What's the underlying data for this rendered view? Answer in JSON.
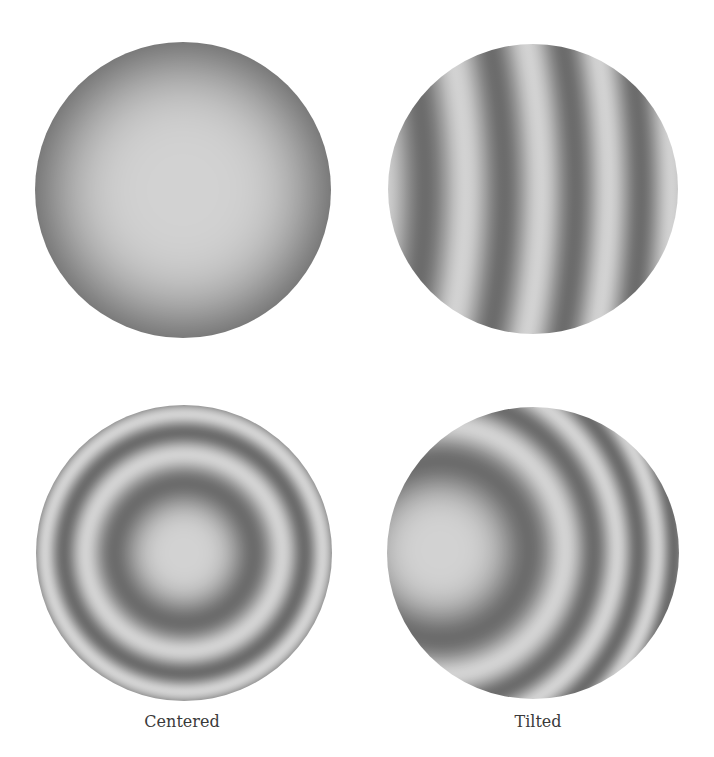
{
  "figure": {
    "colors": {
      "background": "#ffffff",
      "fringe_dark": "#6c6c6c",
      "fringe_light": "#d2d2d2",
      "label": "#3a3a3a"
    },
    "panels": [
      {
        "id": "top-left",
        "name": "defocus-half-fringe",
        "cx": 183,
        "cy": 190,
        "r": 148,
        "ring_cx": 183,
        "ring_cy": 190,
        "r2_period": 58000,
        "phase": 0
      },
      {
        "id": "top-right",
        "name": "tilted-straightish-fringes",
        "cx": 533,
        "cy": 189,
        "r": 145,
        "ring_cx": -225,
        "ring_cy": 190,
        "r2_period": 109000,
        "phase": 0.62
      },
      {
        "id": "bottom-left",
        "name": "centered-rings",
        "cx": 184,
        "cy": 553,
        "r": 148,
        "ring_cx": 184,
        "ring_cy": 553,
        "r2_period": 9650,
        "phase": 0
      },
      {
        "id": "bottom-right",
        "name": "tilted-rings",
        "cx": 533,
        "cy": 553,
        "r": 146,
        "ring_cx": 440,
        "ring_cy": 550,
        "r2_period": 15700,
        "phase": 0
      }
    ],
    "labels": [
      {
        "text": "Centered",
        "x": 182,
        "y": 712
      },
      {
        "text": "Tilted",
        "x": 538,
        "y": 712
      }
    ]
  }
}
